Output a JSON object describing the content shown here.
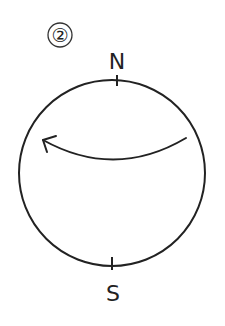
{
  "figure": {
    "number_label": "②",
    "compass": {
      "north_label": "N",
      "south_label": "S"
    },
    "arrow": {
      "direction": "right-to-left",
      "description": "curved arrow across upper part of circle"
    },
    "colors": {
      "stroke": "#222222",
      "background": "#ffffff"
    }
  }
}
